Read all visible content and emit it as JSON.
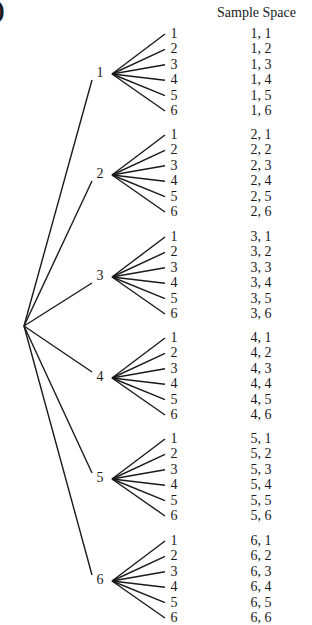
{
  "figure": {
    "corner_glyph": ")",
    "header": "Sample Space",
    "root": {
      "x": 24,
      "y": 326
    },
    "first_level": [
      {
        "label": "1",
        "y": 74,
        "outcomes": [
          "1, 1",
          "1, 2",
          "1, 3",
          "1, 4",
          "1, 5",
          "1, 6"
        ]
      },
      {
        "label": "2",
        "y": 175,
        "outcomes": [
          "2, 1",
          "2, 2",
          "2, 3",
          "2, 4",
          "2, 5",
          "2, 6"
        ]
      },
      {
        "label": "3",
        "y": 277,
        "outcomes": [
          "3, 1",
          "3, 2",
          "3, 3",
          "3, 4",
          "3, 5",
          "3, 6"
        ]
      },
      {
        "label": "4",
        "y": 378,
        "outcomes": [
          "4, 1",
          "4, 2",
          "4, 3",
          "4, 4",
          "4, 5",
          "4, 6"
        ]
      },
      {
        "label": "5",
        "y": 479,
        "outcomes": [
          "5, 1",
          "5, 2",
          "5, 3",
          "5, 4",
          "5, 5",
          "5, 6"
        ]
      },
      {
        "label": "6",
        "y": 581,
        "outcomes": [
          "6, 1",
          "6, 2",
          "6, 3",
          "6, 4",
          "6, 5",
          "6, 6"
        ]
      }
    ],
    "second_level_labels": [
      "1",
      "2",
      "3",
      "4",
      "5",
      "6"
    ],
    "line_color": "#1a1a1a"
  }
}
